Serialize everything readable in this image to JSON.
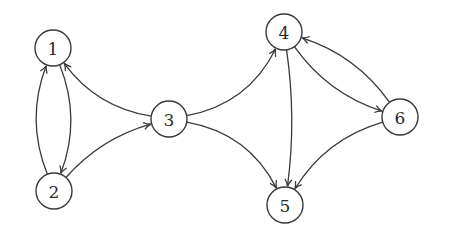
{
  "diagram": {
    "type": "directed-graph",
    "colors": {
      "stroke": "#3a3a3a",
      "label": "#2a2a2a",
      "background": "#ffffff"
    },
    "node_radius": 18,
    "nodes": [
      {
        "id": "1",
        "label": "1",
        "x": 53,
        "y": 48
      },
      {
        "id": "2",
        "label": "2",
        "x": 54,
        "y": 191
      },
      {
        "id": "3",
        "label": "3",
        "x": 169,
        "y": 119
      },
      {
        "id": "4",
        "label": "4",
        "x": 284,
        "y": 32
      },
      {
        "id": "5",
        "label": "5",
        "x": 285,
        "y": 205
      },
      {
        "id": "6",
        "label": "6",
        "x": 400,
        "y": 117
      }
    ],
    "edges": [
      {
        "from": "1",
        "to": "2",
        "bend": 14
      },
      {
        "from": "2",
        "to": "1",
        "bend": 14
      },
      {
        "from": "2",
        "to": "3",
        "bend": 10
      },
      {
        "from": "3",
        "to": "1",
        "bend": 14
      },
      {
        "from": "3",
        "to": "4",
        "bend": -18
      },
      {
        "from": "3",
        "to": "5",
        "bend": 18
      },
      {
        "from": "4",
        "to": "5",
        "bend": 6
      },
      {
        "from": "4",
        "to": "6",
        "bend": -12
      },
      {
        "from": "6",
        "to": "4",
        "bend": -12
      },
      {
        "from": "6",
        "to": "5",
        "bend": -14
      }
    ]
  }
}
